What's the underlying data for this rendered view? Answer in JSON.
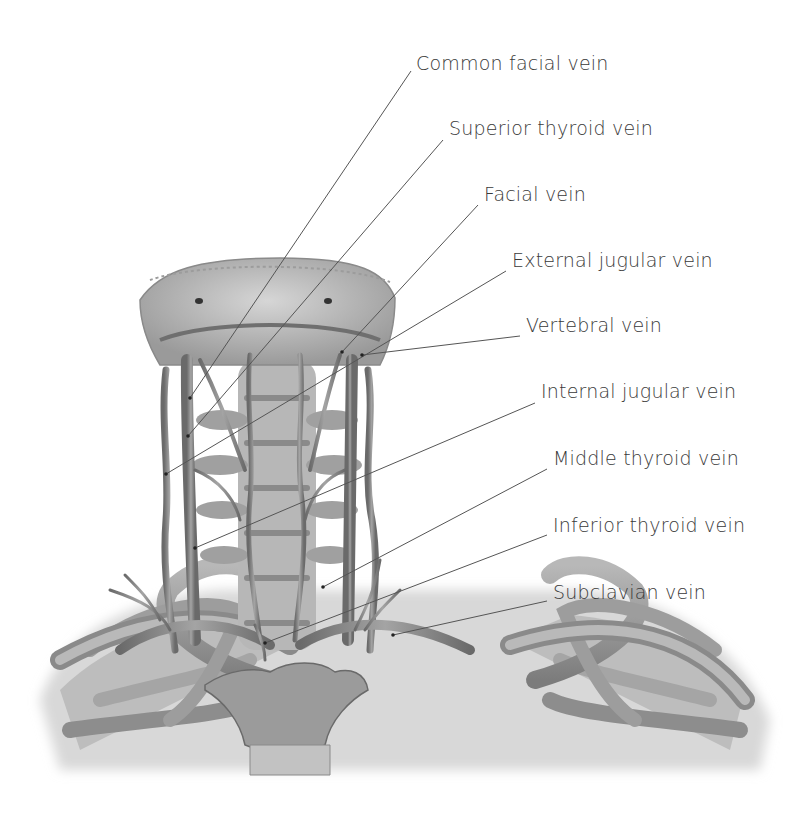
{
  "diagram": {
    "colors": {
      "background": "#ffffff",
      "label_text": "#3a3a3a",
      "leader_line": "#555555",
      "bone_light": "#c9c9c9",
      "bone_mid": "#a8a8a8",
      "bone_dark": "#6e6e6e",
      "vein": "#8a8a8a"
    },
    "labels": [
      {
        "id": "common-facial-vein",
        "text": "Common facial vein",
        "x": 416,
        "y": 52,
        "line": [
          411,
          71,
          190,
          398
        ]
      },
      {
        "id": "superior-thyroid-vein",
        "text": "Superior thyroid vein",
        "x": 449,
        "y": 117,
        "line": [
          443,
          140,
          188,
          436
        ]
      },
      {
        "id": "facial-vein",
        "text": "Facial vein",
        "x": 484,
        "y": 183,
        "line": [
          478,
          205,
          342,
          352
        ]
      },
      {
        "id": "external-jugular-vein",
        "text": "External jugular vein",
        "x": 512,
        "y": 249,
        "line": [
          506,
          271,
          166,
          474
        ]
      },
      {
        "id": "vertebral-vein",
        "text": "Vertebral vein",
        "x": 526,
        "y": 314,
        "line": [
          520,
          336,
          362,
          355
        ]
      },
      {
        "id": "internal-jugular-vein",
        "text": "Internal jugular vein",
        "x": 541,
        "y": 380,
        "line": [
          535,
          403,
          195,
          548
        ]
      },
      {
        "id": "middle-thyroid-vein",
        "text": "Middle thyroid vein",
        "x": 553,
        "y": 447,
        "line": [
          547,
          469,
          323,
          587
        ]
      },
      {
        "id": "inferior-thyroid-vein",
        "text": "Inferior thyroid vein",
        "x": 553,
        "y": 514,
        "line": [
          547,
          535,
          265,
          643
        ]
      },
      {
        "id": "subclavian-vein",
        "text": "Subclavian vein",
        "x": 553,
        "y": 581,
        "line": [
          547,
          601,
          393,
          635
        ]
      }
    ]
  }
}
